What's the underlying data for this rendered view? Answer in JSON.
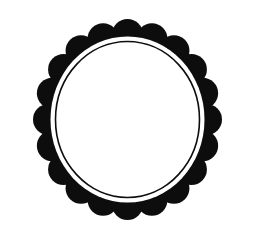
{
  "canvas": {
    "width": 257,
    "height": 239,
    "background_color": "#ffffff"
  },
  "frame": {
    "name": "image-frame-border",
    "left": 7,
    "top": 8,
    "width": 241,
    "height": 220,
    "border_color": "#9a9a9a",
    "border_width": 1,
    "fill_color": "#fefefe"
  },
  "artwork": {
    "title": "scalloped oval frame ornament",
    "ink_color": "#0d0d0d",
    "paper_color": "#ffffff",
    "center_x": 127.5,
    "center_y": 119.5,
    "scallop_ring": {
      "name": "scalloped-outer-ring",
      "scallop_count": 20,
      "scallop_radius": 15.5,
      "path_radius_x": 79,
      "path_radius_y": 85,
      "outer_extent_x": [
        33,
        222
      ],
      "outer_extent_y": [
        19,
        220
      ]
    },
    "ring_inner_ellipse": {
      "name": "ring-inner-cutout-ellipse",
      "radius_x": 77,
      "radius_y": 83
    },
    "thin_outline_ellipse": {
      "name": "thin-inner-outline-ellipse",
      "radius_x": 72,
      "radius_y": 78,
      "stroke_width": 1.6
    },
    "interior": {
      "name": "blank-interior-field",
      "radius_x": 70,
      "radius_y": 76,
      "fill_color": "#ffffff"
    }
  }
}
